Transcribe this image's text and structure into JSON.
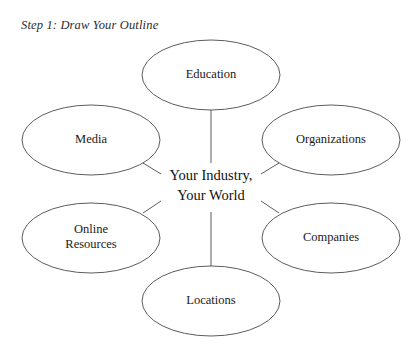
{
  "title": "Step 1: Draw Your Outline",
  "center": {
    "line1": "Your Industry,",
    "line2": "Your World",
    "text": "Your Industry,\nYour World"
  },
  "nodes": [
    {
      "id": "education",
      "label": "Education",
      "cx": 211,
      "cy": 75,
      "rx": 69,
      "ry": 35
    },
    {
      "id": "media",
      "label": "Media",
      "cx": 91,
      "cy": 140,
      "rx": 69,
      "ry": 35
    },
    {
      "id": "organizations",
      "label": "Organizations",
      "cx": 331,
      "cy": 140,
      "rx": 69,
      "ry": 35
    },
    {
      "id": "online-resources",
      "label": "Online\nResources",
      "cx": 91,
      "cy": 238,
      "rx": 69,
      "ry": 35
    },
    {
      "id": "companies",
      "label": "Companies",
      "cx": 331,
      "cy": 238,
      "rx": 69,
      "ry": 35
    },
    {
      "id": "locations",
      "label": "Locations",
      "cx": 211,
      "cy": 301,
      "rx": 69,
      "ry": 35
    }
  ],
  "colors": {
    "background": "#ffffff",
    "stroke": "#4a4a4a",
    "text": "#1a1a1a",
    "title_text": "#2b2b2b"
  },
  "style": {
    "stroke_width": "0.9",
    "shape": "ellipse"
  },
  "connectors": [
    {
      "from": "education",
      "to": "center",
      "kind": "vertical"
    },
    {
      "from": "locations",
      "to": "center",
      "kind": "vertical"
    },
    {
      "from": "media",
      "to": "center",
      "kind": "diagonal"
    },
    {
      "from": "organizations",
      "to": "center",
      "kind": "diagonal"
    },
    {
      "from": "online-resources",
      "to": "center",
      "kind": "diagonal"
    },
    {
      "from": "companies",
      "to": "center",
      "kind": "diagonal"
    }
  ]
}
